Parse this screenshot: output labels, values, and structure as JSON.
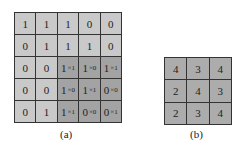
{
  "figure_a": {
    "caption": "(a)",
    "rows": [
      [
        {
          "v": "1"
        },
        {
          "v": "1"
        },
        {
          "v": "1"
        },
        {
          "v": "0"
        },
        {
          "v": "0"
        }
      ],
      [
        {
          "v": "0"
        },
        {
          "v": "1"
        },
        {
          "v": "1"
        },
        {
          "v": "1"
        },
        {
          "v": "0"
        }
      ],
      [
        {
          "v": "0"
        },
        {
          "v": "0"
        },
        {
          "v": "1",
          "s": "×1",
          "dark": true
        },
        {
          "v": "1",
          "s": "×0",
          "dark": true
        },
        {
          "v": "1",
          "s": "×1",
          "dark": true
        }
      ],
      [
        {
          "v": "0"
        },
        {
          "v": "0"
        },
        {
          "v": "1",
          "s": "×0",
          "dark": true
        },
        {
          "v": "1",
          "s": "×1",
          "dark": true
        },
        {
          "v": "0",
          "s": "×0",
          "dark": true
        }
      ],
      [
        {
          "v": "0"
        },
        {
          "v": "1"
        },
        {
          "v": "1",
          "s": "×1",
          "dark": true
        },
        {
          "v": "0",
          "s": "×0",
          "dark": true
        },
        {
          "v": "0",
          "s": "×1",
          "dark": true
        }
      ]
    ]
  },
  "figure_b": {
    "caption": "(b)",
    "rows": [
      [
        "4",
        "3",
        "4"
      ],
      [
        "2",
        "4",
        "3"
      ],
      [
        "2",
        "3",
        "4"
      ]
    ]
  },
  "colors": {
    "light_cell": "#c9c9c9",
    "dark_cell": "#a3a3a3",
    "result_cell": "#acacac",
    "border": "#333333"
  }
}
